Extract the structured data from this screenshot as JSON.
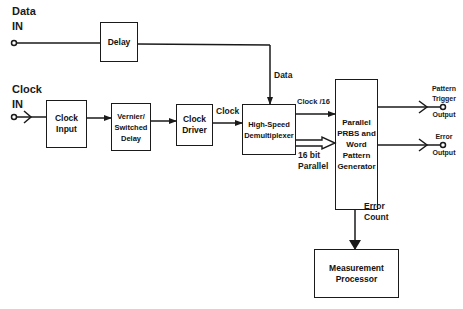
{
  "diagram": {
    "inputs": {
      "data_in": {
        "line1": "Data",
        "line2": "IN"
      },
      "clock_in": {
        "line1": "Clock",
        "line2": "IN"
      }
    },
    "blocks": {
      "delay": "Delay",
      "clock_input": {
        "line1": "Clock",
        "line2": "Input"
      },
      "vernier": {
        "line1": "Vernier/",
        "line2": "Switched",
        "line3": "Delay"
      },
      "clock_driver": {
        "line1": "Clock",
        "line2": "Driver"
      },
      "demux": {
        "line1": "High-Speed",
        "line2": "Demultiplexer"
      },
      "prbs": {
        "line1": "Parallel",
        "line2": "PRBS and",
        "line3": "Word",
        "line4": "Pattern",
        "line5": "Generator"
      },
      "measurement": {
        "line1": "Measurement",
        "line2": "Processor"
      }
    },
    "signals": {
      "data": "Data",
      "clock": "Clock",
      "clock_div": "Clock /16",
      "parallel": {
        "line1": "16 bit",
        "line2": "Parallel"
      },
      "error_count": {
        "line1": "Error",
        "line2": "Count"
      }
    },
    "outputs": {
      "pattern_trigger": {
        "line1": "Pattern",
        "line2": "Trigger",
        "line3": "Output"
      },
      "error": {
        "line1": "Error",
        "line2": "Output"
      }
    },
    "colors": {
      "line": "#1a1a1a",
      "background": "#ffffff"
    }
  }
}
